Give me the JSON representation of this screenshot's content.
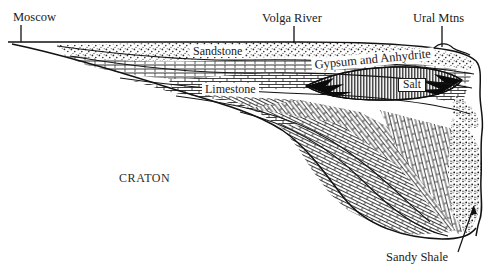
{
  "figure": {
    "type": "geologic-cross-section",
    "title_visible": false,
    "orientation": "west-to-east",
    "background_color": "#ffffff",
    "ink_color": "#1a1a1a"
  },
  "callout_labels": [
    {
      "id": "moscow",
      "text": "Moscow",
      "x": 13,
      "y": 11,
      "leader": {
        "type": "vertical",
        "x": 21,
        "y1": 25,
        "y2": 42
      }
    },
    {
      "id": "volga-river",
      "text": "Volga River",
      "x": 262,
      "y": 12,
      "leader": {
        "type": "vertical",
        "x": 294,
        "y1": 26,
        "y2": 43
      }
    },
    {
      "id": "ural-mtns",
      "text": "Ural Mtns",
      "x": 413,
      "y": 12,
      "leader": {
        "type": "vertical",
        "x": 442,
        "y1": 26,
        "y2": 47
      }
    }
  ],
  "unit_labels": [
    {
      "id": "sandstone",
      "text": "Sandstone",
      "x": 192,
      "y": 46
    },
    {
      "id": "limestone",
      "text": "Limestone",
      "x": 203,
      "y": 83
    },
    {
      "id": "gypsum-and-anhydrite",
      "text": "Gypsum and Anhydrite",
      "x": 312,
      "y": 60
    },
    {
      "id": "salt",
      "text": "Salt",
      "x": 399,
      "y": 79
    }
  ],
  "basement_label": {
    "id": "craton",
    "text": "CRATON",
    "x": 119,
    "y": 172
  },
  "pointer_labels": [
    {
      "id": "sandy-shale",
      "text": "Sandy Shale",
      "x": 386,
      "y": 251,
      "leader": {
        "type": "diagonal",
        "x1": 458,
        "y1": 252,
        "x2": 474,
        "y2": 205
      }
    }
  ],
  "lithologies": [
    {
      "id": "sandstone",
      "pattern": "stipple",
      "description": "dotted / stippled sand"
    },
    {
      "id": "limestone",
      "pattern": "brick",
      "description": "brick hatch carbonate"
    },
    {
      "id": "evaporite",
      "pattern": "vertical-hatch",
      "description": "dense vertical lines, gypsum and anhydrite"
    },
    {
      "id": "salt",
      "pattern": "solid-dark-lens",
      "description": "dark lenticular salt body"
    },
    {
      "id": "sandy-shale",
      "pattern": "speckle",
      "description": "speckled sandy shale near Urals"
    }
  ]
}
